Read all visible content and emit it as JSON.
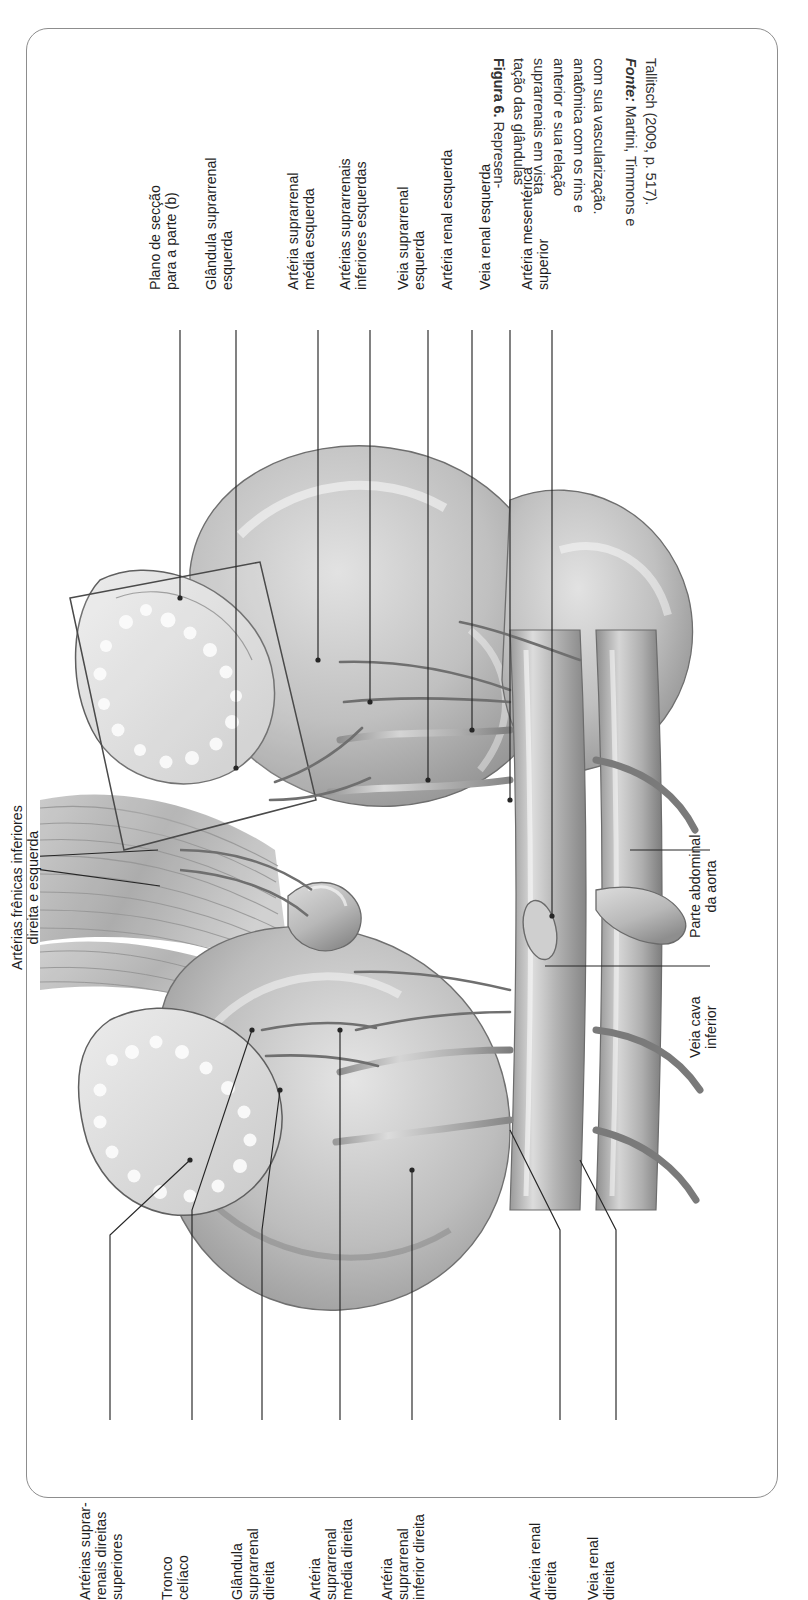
{
  "figure": {
    "caption_lines": [
      "Figura 6. Represen-",
      "tação das glândulas",
      "suprarrenais em vista",
      "anterior e sua relação",
      "anatômica com os rins e",
      "com sua vascularização."
    ],
    "caption_bold_prefix": "Figura 6.",
    "source_lines": [
      "Fonte: Martini, Timmons e",
      "Tallitsch (2009, p. 517)."
    ],
    "source_label": "Fonte:",
    "source_text_line1": " Martini, Timmons e",
    "source_text_line2": "Tallitsch (2009, p. 517)."
  },
  "labels": {
    "top_group": [
      {
        "id": "plano-seccao",
        "lines": [
          "Plano de secção",
          "para a parte (b)"
        ]
      },
      {
        "id": "glandula-suprarrenal-esquerda",
        "lines": [
          "Glândula suprarrenal",
          "esquerda"
        ]
      },
      {
        "id": "arteria-suprarrenal-media-esquerda",
        "lines": [
          "Artéria suprarrenal",
          "média esquerda"
        ]
      },
      {
        "id": "arterias-suprarrenais-inferiores-esquerdas",
        "lines": [
          "Artérias suprarrenais",
          "inferiores esquerdas"
        ]
      },
      {
        "id": "veia-suprarrenal-esquerda",
        "lines": [
          "Veia suprarrenal",
          "esquerda"
        ]
      },
      {
        "id": "arteria-renal-esquerda",
        "lines": [
          "Artéria renal esquerda"
        ]
      },
      {
        "id": "veia-renal-esquerda",
        "lines": [
          "Veia renal esquerda"
        ]
      },
      {
        "id": "arteria-mesenterica-superior",
        "lines": [
          "Artéria mesentérica",
          "superior"
        ]
      }
    ],
    "left_group": [
      {
        "id": "arterias-frenicas-inferiores",
        "lines": [
          "Artérias frênicas inferiores",
          "direita e esquerda"
        ]
      }
    ],
    "right_group": [
      {
        "id": "parte-abdominal-aorta",
        "lines": [
          "Parte abdominal",
          "da aorta"
        ]
      },
      {
        "id": "veia-cava-inferior",
        "lines": [
          "Veia cava",
          "inferior"
        ]
      }
    ],
    "bottom_group": [
      {
        "id": "arterias-suprarrenais-direitas-superiores",
        "lines": [
          "Artérias suprar-",
          "renais direitas",
          "superiores"
        ]
      },
      {
        "id": "tronco-celiaco",
        "lines": [
          "Tronco",
          "celíaco"
        ]
      },
      {
        "id": "glandula-suprarrenal-direita",
        "lines": [
          "Glândula",
          "suprarrenal",
          "direita"
        ]
      },
      {
        "id": "arteria-suprarrenal-media-direita",
        "lines": [
          "Artéria",
          "suprarrenal",
          "média direita"
        ]
      },
      {
        "id": "arteria-suprarrenal-inferior-direita",
        "lines": [
          "Artéria",
          "suprarrenal",
          "inferior direita"
        ]
      }
    ],
    "bottom_right_group": [
      {
        "id": "arteria-renal-direita",
        "lines": [
          "Artéria renal",
          "direita"
        ]
      },
      {
        "id": "veia-renal-direita",
        "lines": [
          "Veia renal",
          "direita"
        ]
      }
    ]
  },
  "colors": {
    "frame": "#8d8d8d",
    "text": "#1f1f1f",
    "caption_text": "#333333",
    "leader": "#2a2a2a",
    "organ_light": "#d8d8d8",
    "organ_mid": "#b3b3b3",
    "organ_dark": "#8a8a8a",
    "background": "#ffffff"
  }
}
